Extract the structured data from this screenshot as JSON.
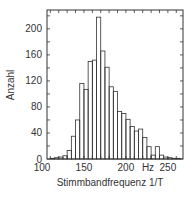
{
  "chart_data": {
    "type": "bar",
    "title": "",
    "xlabel": "Stimmbandfrequenz 1/T",
    "ylabel": "Anzahl",
    "x_unit_label": "Hz",
    "xlim": [
      106,
      268
    ],
    "ylim": [
      0,
      229
    ],
    "bin_width": 5,
    "x_ticks": [
      100,
      150,
      200,
      250
    ],
    "y_ticks": [
      0,
      40,
      80,
      120,
      160,
      200
    ],
    "grid": false,
    "legend": null,
    "bins": [
      110,
      115,
      120,
      125,
      130,
      135,
      140,
      145,
      150,
      155,
      160,
      165,
      170,
      175,
      180,
      185,
      190,
      195,
      200,
      205,
      210,
      215,
      220,
      225,
      230,
      235,
      240,
      245,
      250,
      255,
      260
    ],
    "values": [
      1,
      2,
      3,
      5,
      13,
      35,
      60,
      116,
      107,
      150,
      152,
      218,
      166,
      141,
      111,
      104,
      73,
      70,
      61,
      50,
      43,
      46,
      33,
      19,
      6,
      19,
      6,
      3,
      2,
      1,
      1
    ]
  }
}
